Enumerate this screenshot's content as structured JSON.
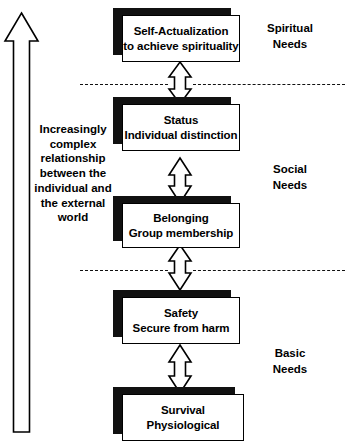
{
  "diagram": {
    "caption": "Increasingly complex relationship between the individual and the external world",
    "levels": [
      {
        "id": "self-actualization",
        "heading": "Self-Actualization",
        "subheading": "to achieve spirituality"
      },
      {
        "id": "status",
        "heading": "Status",
        "subheading": "Individual distinction"
      },
      {
        "id": "belonging",
        "heading": "Belonging",
        "subheading": "Group membership"
      },
      {
        "id": "safety",
        "heading": "Safety",
        "subheading": "Secure from harm"
      },
      {
        "id": "survival",
        "heading": "Survival",
        "subheading": "Physiological"
      }
    ],
    "categories": [
      {
        "id": "spiritual",
        "line1": "Spiritual",
        "line2": "Needs"
      },
      {
        "id": "social",
        "line1": "Social",
        "line2": "Needs"
      },
      {
        "id": "basic",
        "line1": "Basic",
        "line2": "Needs"
      }
    ],
    "colors": {
      "ink": "#000000",
      "shadow": "#111111",
      "paper": "#ffffff"
    }
  }
}
